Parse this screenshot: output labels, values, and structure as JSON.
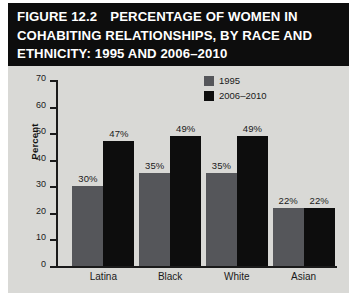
{
  "figure": {
    "title_lines": [
      {
        "number": "FIGURE 12.2",
        "text": "PERCENTAGE OF WOMEN IN"
      },
      {
        "number": "",
        "text": "COHABITING RELATIONSHIPS, BY RACE AND"
      },
      {
        "number": "",
        "text": "ETHNICITY: 1995 AND 2006–2010"
      }
    ]
  },
  "colors": {
    "banner_background": "#0d0d0d",
    "banner_text": "#ffffff",
    "panel_background": "#d9d9d6",
    "series_1995": "#55565a",
    "series_2006_2010": "#0d0d0d",
    "axis": "#1a1a1a"
  },
  "chart_data": {
    "type": "bar",
    "xlabel": "",
    "ylabel": "Percent",
    "ylim": [
      0,
      70
    ],
    "ytick_interval": 10,
    "yticks": [
      0,
      10,
      20,
      30,
      40,
      50,
      60,
      70
    ],
    "ytick_labels": [
      "0",
      "10",
      "20",
      "30",
      "40",
      "50",
      "60",
      "70"
    ],
    "grid": false,
    "legend_position": "top-right",
    "categories": [
      "Latina",
      "Black",
      "White",
      "Asian"
    ],
    "series": [
      {
        "name": "1995",
        "color": "#55565a",
        "values": [
          30,
          35,
          35,
          22
        ],
        "labels": [
          "30%",
          "35%",
          "35%",
          "22%"
        ]
      },
      {
        "name": "2006–2010",
        "color": "#0d0d0d",
        "values": [
          47,
          49,
          49,
          22
        ],
        "labels": [
          "47%",
          "49%",
          "49%",
          "22%"
        ]
      }
    ]
  }
}
